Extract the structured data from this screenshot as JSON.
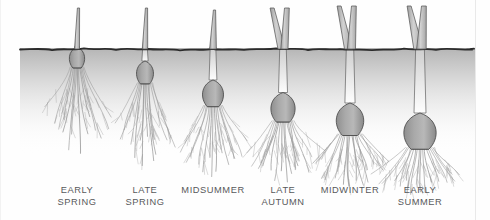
{
  "figure": {
    "type": "botanical-growth-stages",
    "ground_line_y": 48,
    "background_color": "#ffffff",
    "soil_top_color": "#b9b9b9",
    "soil_bottom_color": "#ffffff",
    "ground_stroke_color": "#2b2b2b",
    "bulb_fill_color": "#a8a8a8",
    "bulb_stroke_color": "#4a4a4a",
    "leaf_fill_color": "#c8c8c8",
    "leaf_stroke_color": "#5a5a5a",
    "root_color": "#9a9a9a",
    "label_color": "#58595b"
  },
  "stages": [
    {
      "id": "early-spring",
      "label_lines": [
        "EARLY",
        "SPRING"
      ],
      "label_x": 77,
      "label_y": 185,
      "bulb": {
        "cx": 77,
        "cy": 58,
        "rx": 9.5,
        "ry": 11
      },
      "depth": 10,
      "leaf_type": "single-thin",
      "shoot_top_y": 8,
      "root_length": 72,
      "root_count": 14
    },
    {
      "id": "late-spring",
      "label_lines": [
        "LATE",
        "SPRING"
      ],
      "label_x": 145,
      "label_y": 185,
      "bulb": {
        "cx": 145,
        "cy": 73,
        "rx": 10.5,
        "ry": 12
      },
      "depth": 25,
      "leaf_type": "single-thin",
      "shoot_top_y": 8,
      "root_length": 70,
      "root_count": 14
    },
    {
      "id": "midsummer",
      "label_lines": [
        "MIDSUMMER"
      ],
      "label_x": 213,
      "label_y": 185,
      "bulb": {
        "cx": 213,
        "cy": 94,
        "rx": 13,
        "ry": 14
      },
      "depth": 46,
      "leaf_type": "single-thin",
      "shoot_top_y": 10,
      "root_length": 60,
      "root_count": 15
    },
    {
      "id": "late-autumn",
      "label_lines": [
        "LATE",
        "AUTUMN"
      ],
      "label_x": 283,
      "label_y": 185,
      "bulb": {
        "cx": 283,
        "cy": 108,
        "rx": 15,
        "ry": 15.5
      },
      "depth": 60,
      "leaf_type": "double-v",
      "shoot_top_y": 8,
      "root_length": 52,
      "root_count": 16
    },
    {
      "id": "midwinter",
      "label_lines": [
        "MIDWINTER"
      ],
      "label_x": 350,
      "label_y": 185,
      "bulb": {
        "cx": 350,
        "cy": 120,
        "rx": 17,
        "ry": 17
      },
      "depth": 72,
      "leaf_type": "double-v",
      "shoot_top_y": 6,
      "root_length": 46,
      "root_count": 17
    },
    {
      "id": "early-summer",
      "label_lines": [
        "EARLY",
        "SUMMER"
      ],
      "label_x": 420,
      "label_y": 185,
      "bulb": {
        "cx": 420,
        "cy": 132,
        "rx": 20,
        "ry": 19
      },
      "depth": 84,
      "leaf_type": "double-v",
      "shoot_top_y": 6,
      "root_length": 40,
      "root_count": 18
    }
  ]
}
